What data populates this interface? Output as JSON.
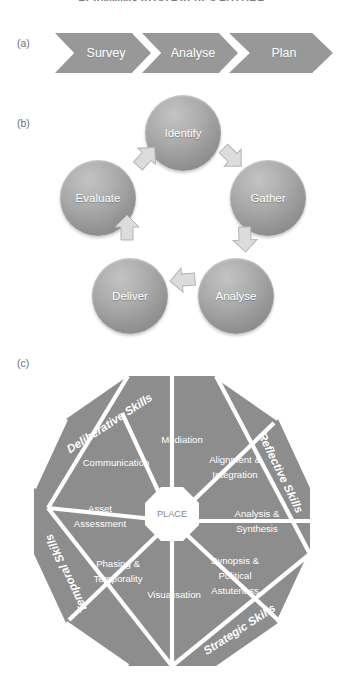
{
  "document": {
    "title": "PLANNING AUSTRALIA'S FUTURE"
  },
  "panels": {
    "a": {
      "label": "(a)"
    },
    "b": {
      "label": "(b)"
    },
    "c": {
      "label": "(c)"
    }
  },
  "process_chevrons": {
    "steps": [
      {
        "label": "Survey"
      },
      {
        "label": "Analyse"
      },
      {
        "label": "Plan"
      }
    ]
  },
  "cycle_diagram": {
    "nodes": [
      {
        "label": "Identify",
        "position": "top"
      },
      {
        "label": "Gather",
        "position": "right"
      },
      {
        "label": "Analyse",
        "position": "bottom-right"
      },
      {
        "label": "Deliver",
        "position": "bottom-left"
      },
      {
        "label": "Evaluate",
        "position": "left"
      }
    ],
    "arrows": [
      {
        "name": "arrow-evaluate-to-identify",
        "from": "Evaluate",
        "to": "Identify"
      },
      {
        "name": "arrow-identify-to-gather",
        "from": "Identify",
        "to": "Gather"
      },
      {
        "name": "arrow-gather-to-analyse",
        "from": "Gather",
        "to": "Analyse"
      },
      {
        "name": "arrow-analyse-to-deliver",
        "from": "Analyse",
        "to": "Deliver"
      },
      {
        "name": "arrow-deliver-to-evaluate",
        "from": "Deliver",
        "to": "Evaluate"
      }
    ]
  },
  "octagon_diagram": {
    "hub": {
      "label": "PLACE"
    },
    "segments": [
      {
        "label_lines": [
          "Mediation"
        ]
      },
      {
        "label_lines": [
          "Alignment &",
          "Integration"
        ]
      },
      {
        "label_lines": [
          "Analysis &",
          "Synthesis"
        ]
      },
      {
        "label_lines": [
          "Synopsis &",
          "Political",
          "Astuteness"
        ]
      },
      {
        "label_lines": [
          "Visualisation"
        ]
      },
      {
        "label_lines": [
          "Phasing &",
          "Temporality"
        ]
      },
      {
        "label_lines": [
          "Asset",
          "Assessment"
        ]
      },
      {
        "label_lines": [
          "Communication"
        ]
      }
    ],
    "rings": [
      {
        "label": "Deliberative Skills",
        "corner": "top-left"
      },
      {
        "label": "Reflective Skills",
        "corner": "top-right"
      },
      {
        "label": "Strategic Skills",
        "corner": "bottom-right"
      },
      {
        "label": "Temporal Skills",
        "corner": "bottom-left"
      }
    ]
  },
  "colors": {
    "fill_gray": "#8d8d8d",
    "chevron_gray": "#989898",
    "sphere_gray": "#a8a8a8",
    "divider_white": "#ffffff",
    "text_gray": "#6d6e71"
  }
}
